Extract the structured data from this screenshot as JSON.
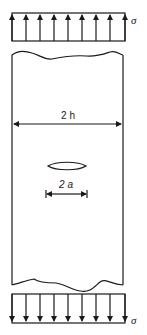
{
  "figure": {
    "top_load": {
      "label": "σ",
      "direction": "up",
      "arrow_count": 9
    },
    "bottom_load": {
      "label": "σ",
      "direction": "down",
      "arrow_count": 9
    },
    "plate": {
      "width_label": "2 h"
    },
    "crack": {
      "length_label": "2 a"
    }
  }
}
